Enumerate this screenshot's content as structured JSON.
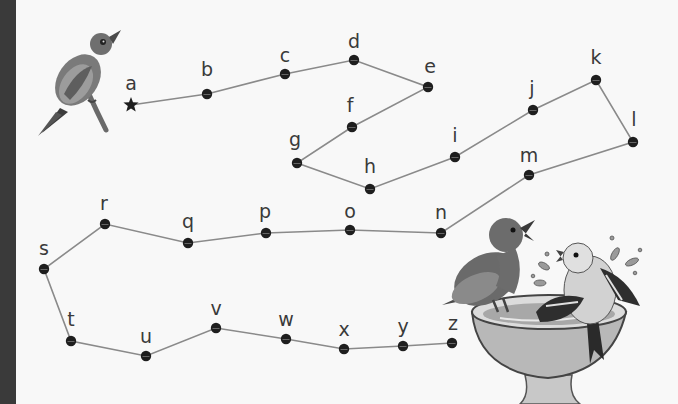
{
  "activity": {
    "type": "connect-the-dots",
    "sequence": "alphabet a-z",
    "start_marker": "star-icon",
    "line_color": "#8a8a8a",
    "dot_color": "#1e1e1e",
    "label_color": "#3a3a3a",
    "border_color": "#3a3a3a"
  },
  "dots": [
    {
      "letter": "a",
      "x": 131,
      "y": 105,
      "lx": 131,
      "ly": 90,
      "start": true
    },
    {
      "letter": "b",
      "x": 207,
      "y": 94,
      "lx": 207,
      "ly": 76
    },
    {
      "letter": "c",
      "x": 285,
      "y": 74,
      "lx": 285,
      "ly": 62
    },
    {
      "letter": "d",
      "x": 354,
      "y": 60,
      "lx": 354,
      "ly": 48
    },
    {
      "letter": "e",
      "x": 428,
      "y": 87,
      "lx": 430,
      "ly": 73
    },
    {
      "letter": "f",
      "x": 352,
      "y": 127,
      "lx": 350,
      "ly": 112
    },
    {
      "letter": "g",
      "x": 297,
      "y": 163,
      "lx": 295,
      "ly": 146
    },
    {
      "letter": "h",
      "x": 370,
      "y": 189,
      "lx": 370,
      "ly": 173
    },
    {
      "letter": "i",
      "x": 455,
      "y": 157,
      "lx": 455,
      "ly": 142
    },
    {
      "letter": "j",
      "x": 533,
      "y": 110,
      "lx": 532,
      "ly": 95
    },
    {
      "letter": "k",
      "x": 596,
      "y": 80,
      "lx": 596,
      "ly": 64
    },
    {
      "letter": "l",
      "x": 633,
      "y": 142,
      "lx": 634,
      "ly": 126
    },
    {
      "letter": "m",
      "x": 529,
      "y": 175,
      "lx": 529,
      "ly": 162
    },
    {
      "letter": "n",
      "x": 441,
      "y": 233,
      "lx": 441,
      "ly": 219
    },
    {
      "letter": "o",
      "x": 350,
      "y": 230,
      "lx": 350,
      "ly": 218
    },
    {
      "letter": "p",
      "x": 266,
      "y": 233,
      "lx": 265,
      "ly": 218
    },
    {
      "letter": "q",
      "x": 188,
      "y": 243,
      "lx": 188,
      "ly": 228
    },
    {
      "letter": "r",
      "x": 105,
      "y": 224,
      "lx": 104,
      "ly": 210
    },
    {
      "letter": "s",
      "x": 44,
      "y": 269,
      "lx": 44,
      "ly": 255
    },
    {
      "letter": "t",
      "x": 71,
      "y": 341,
      "lx": 71,
      "ly": 326
    },
    {
      "letter": "u",
      "x": 146,
      "y": 356,
      "lx": 146,
      "ly": 343
    },
    {
      "letter": "v",
      "x": 216,
      "y": 328,
      "lx": 216,
      "ly": 315
    },
    {
      "letter": "w",
      "x": 286,
      "y": 339,
      "lx": 286,
      "ly": 326
    },
    {
      "letter": "x",
      "x": 344,
      "y": 349,
      "lx": 344,
      "ly": 336
    },
    {
      "letter": "y",
      "x": 403,
      "y": 346,
      "lx": 403,
      "ly": 333
    },
    {
      "letter": "z",
      "x": 452,
      "y": 343,
      "lx": 453,
      "ly": 330
    }
  ],
  "illustrations": [
    {
      "name": "perched-bird",
      "description": "bird on branch, top-left"
    },
    {
      "name": "birdbath-with-two-birds",
      "description": "two birds at splashing birdbath, bottom-right"
    }
  ]
}
